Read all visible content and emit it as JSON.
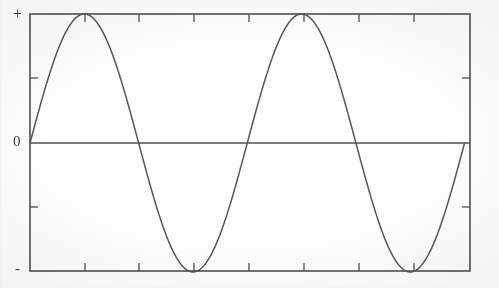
{
  "figure": {
    "background_color": "#fdfdfc",
    "ink_color": "#4a4a4a",
    "axis": {
      "y_labels": {
        "positive": "+",
        "zero": "0",
        "negative": "-"
      }
    }
  },
  "chart_data": {
    "type": "line",
    "title": "",
    "subtitle": "",
    "xlabel": "",
    "ylabel": "",
    "waveform": "sine",
    "cycles": 2,
    "amplitude": 1,
    "phase": 0,
    "xlim": [
      0,
      4.05
    ],
    "ylim": [
      -1,
      1
    ],
    "grid": false,
    "legend": null,
    "frame": {
      "left_px": 30,
      "right_px": 470,
      "top_px": 14,
      "bottom_px": 271,
      "zero_line_y_px": 143
    },
    "y_ticks": [
      {
        "label": "+",
        "value": 1
      },
      {
        "label": "",
        "value": 0.5
      },
      {
        "label": "0",
        "value": 0
      },
      {
        "label": "",
        "value": -0.5
      },
      {
        "label": "-",
        "value": -1
      }
    ],
    "x_ticks": [
      {
        "label": "",
        "value": 0.0
      },
      {
        "label": "",
        "value": 0.5
      },
      {
        "label": "",
        "value": 1.0
      },
      {
        "label": "",
        "value": 1.5
      },
      {
        "label": "",
        "value": 2.0
      },
      {
        "label": "",
        "value": 2.5
      },
      {
        "label": "",
        "value": 3.0
      },
      {
        "label": "",
        "value": 3.5
      },
      {
        "label": "",
        "value": 4.0
      }
    ],
    "annotations": [],
    "series": [
      {
        "name": "sine",
        "x": [
          0.0,
          0.1,
          0.2,
          0.3,
          0.4,
          0.5,
          0.6,
          0.7,
          0.8,
          0.9,
          1.0,
          1.1,
          1.2,
          1.3,
          1.4,
          1.5,
          1.6,
          1.7,
          1.8,
          1.9,
          2.0,
          2.1,
          2.2,
          2.3,
          2.4,
          2.5,
          2.6,
          2.7,
          2.8,
          2.9,
          3.0,
          3.1,
          3.2,
          3.3,
          3.4,
          3.5,
          3.6,
          3.7,
          3.8,
          3.9,
          4.0
        ],
        "values": [
          0.0,
          0.309,
          0.588,
          0.809,
          0.951,
          1.0,
          0.951,
          0.809,
          0.588,
          0.309,
          0.0,
          -0.309,
          -0.588,
          -0.809,
          -0.951,
          -1.0,
          -0.951,
          -0.809,
          -0.588,
          -0.309,
          0.0,
          0.309,
          0.588,
          0.809,
          0.951,
          1.0,
          0.951,
          0.809,
          0.588,
          0.309,
          0.0,
          -0.309,
          -0.588,
          -0.809,
          -0.951,
          -1.0,
          -0.951,
          -0.809,
          -0.588,
          -0.309,
          0.0
        ],
        "key_points": {
          "zero_crossings": [
            0.0,
            1.0,
            2.0,
            3.0,
            4.0
          ],
          "maxima": [
            0.5,
            2.5
          ],
          "minima": [
            1.5,
            3.5
          ]
        }
      }
    ]
  }
}
